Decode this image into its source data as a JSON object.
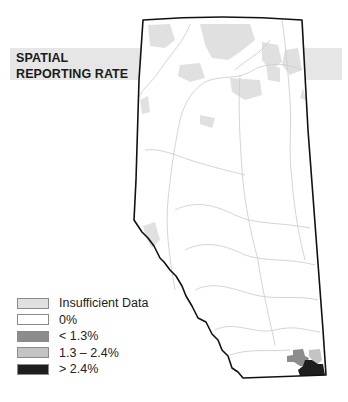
{
  "title": {
    "line1": "SPATIAL",
    "line2": "REPORTING RATE"
  },
  "colors": {
    "title_band": "#e6e6e6",
    "insufficient_data": "#e0e0e0",
    "zero": "#ffffff",
    "low": "#8c8c8c",
    "mid": "#c4c4c4",
    "high": "#1e1e1e",
    "outline": "#111111",
    "rivers": "#cfcfcf"
  },
  "legend": {
    "items": [
      {
        "label": "Insufficient Data",
        "color": "#e0e0e0"
      },
      {
        "label": "0%",
        "color": "#ffffff"
      },
      {
        "label": "< 1.3%",
        "color": "#8c8c8c"
      },
      {
        "label": "1.3 – 2.4%",
        "color": "#c4c4c4"
      },
      {
        "label": "> 2.4%",
        "color": "#1e1e1e"
      }
    ]
  },
  "map": {
    "region": "Alberta",
    "highlighted_area": "south-east corner"
  }
}
